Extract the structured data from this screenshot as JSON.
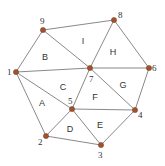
{
  "diagram": {
    "type": "triangulated-mesh",
    "nodes": [
      {
        "id": "1",
        "x": 16,
        "y": 72,
        "lx": 7,
        "ly": 75
      },
      {
        "id": "2",
        "x": 46,
        "y": 136,
        "lx": 38,
        "ly": 145
      },
      {
        "id": "3",
        "x": 101,
        "y": 145,
        "lx": 98,
        "ly": 158
      },
      {
        "id": "4",
        "x": 135,
        "y": 110,
        "lx": 138,
        "ly": 118
      },
      {
        "id": "5",
        "x": 72,
        "y": 109,
        "lx": 68,
        "ly": 104
      },
      {
        "id": "6",
        "x": 149,
        "y": 68,
        "lx": 152,
        "ly": 71
      },
      {
        "id": "7",
        "x": 90,
        "y": 68,
        "lx": 89,
        "ly": 82
      },
      {
        "id": "8",
        "x": 114,
        "y": 20,
        "lx": 118,
        "ly": 18
      },
      {
        "id": "9",
        "x": 43,
        "y": 30,
        "lx": 40,
        "ly": 24
      }
    ],
    "edges": [
      [
        "1",
        "9"
      ],
      [
        "9",
        "8"
      ],
      [
        "8",
        "6"
      ],
      [
        "6",
        "4"
      ],
      [
        "4",
        "3"
      ],
      [
        "3",
        "2"
      ],
      [
        "2",
        "1"
      ],
      [
        "1",
        "7"
      ],
      [
        "1",
        "5"
      ],
      [
        "9",
        "7"
      ],
      [
        "8",
        "7"
      ],
      [
        "7",
        "6"
      ],
      [
        "7",
        "4"
      ],
      [
        "7",
        "5"
      ],
      [
        "5",
        "4"
      ],
      [
        "5",
        "2"
      ],
      [
        "5",
        "3"
      ]
    ],
    "faces": [
      {
        "label": "A",
        "x": 42,
        "y": 106
      },
      {
        "label": "B",
        "x": 45,
        "y": 60
      },
      {
        "label": "C",
        "x": 63,
        "y": 90
      },
      {
        "label": "D",
        "x": 70,
        "y": 132
      },
      {
        "label": "E",
        "x": 100,
        "y": 128
      },
      {
        "label": "F",
        "x": 95,
        "y": 100
      },
      {
        "label": "G",
        "x": 123,
        "y": 88
      },
      {
        "label": "H",
        "x": 113,
        "y": 55
      },
      {
        "label": "I",
        "x": 83,
        "y": 44
      }
    ],
    "colors": {
      "node_fill": "#a0522d",
      "edge": "#6b6b6b",
      "text": "#333333"
    }
  }
}
